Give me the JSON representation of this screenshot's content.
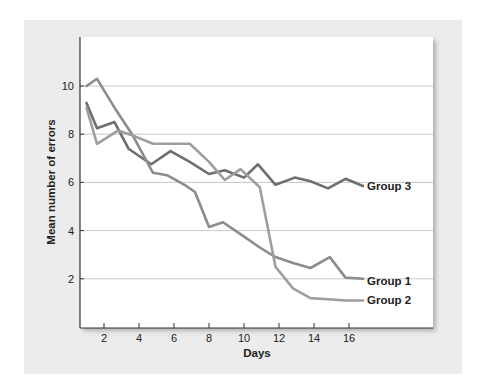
{
  "chart_data": {
    "type": "line",
    "title": "",
    "xlabel": "Days",
    "ylabel": "Mean number of errors",
    "xlim": [
      0.6,
      20.8
    ],
    "ylim": [
      0,
      12
    ],
    "x_ticks": [
      2,
      4,
      6,
      8,
      10,
      12,
      14,
      16
    ],
    "y_ticks": [
      2,
      4,
      6,
      8,
      10
    ],
    "grid": {
      "horizontal": true,
      "vertical": false
    },
    "legend_position": "inline-right-of-line-ends",
    "series": [
      {
        "name": "Group 3",
        "color": "#6e6e6e",
        "x": [
          1,
          1.6,
          2.6,
          3.4,
          4.7,
          5.8,
          6.9,
          8.0,
          8.9,
          10.0,
          10.8,
          11.8,
          12.9,
          13.8,
          14.8,
          15.8,
          16.8
        ],
        "values": [
          9.3,
          8.25,
          8.5,
          7.4,
          6.75,
          7.3,
          6.85,
          6.35,
          6.5,
          6.2,
          6.75,
          5.9,
          6.2,
          6.05,
          5.75,
          6.15,
          5.85
        ]
      },
      {
        "name": "Group 1",
        "color": "#8c8c8c",
        "x": [
          1,
          1.6,
          2.6,
          3.6,
          4.8,
          5.6,
          6.6,
          7.2,
          8.0,
          8.8,
          9.9,
          10.9,
          11.8,
          12.8,
          13.8,
          14.9,
          15.8,
          16.8
        ],
        "values": [
          10.0,
          10.3,
          9.1,
          8.0,
          6.4,
          6.3,
          5.9,
          5.6,
          4.15,
          4.35,
          3.8,
          3.3,
          2.9,
          2.65,
          2.45,
          2.9,
          2.05,
          2.0
        ],
        "label_anchor_value": 2.0
      },
      {
        "name": "Group 2",
        "color": "#9e9e9e",
        "x": [
          1,
          1.6,
          2.8,
          3.8,
          4.8,
          5.8,
          6.9,
          8.0,
          8.9,
          9.8,
          10.9,
          11.8,
          12.8,
          13.8,
          14.8,
          15.8,
          16.8
        ],
        "values": [
          9.1,
          7.6,
          8.15,
          7.9,
          7.6,
          7.6,
          7.6,
          6.85,
          6.1,
          6.55,
          5.8,
          2.5,
          1.6,
          1.2,
          1.15,
          1.1,
          1.1
        ]
      }
    ]
  }
}
